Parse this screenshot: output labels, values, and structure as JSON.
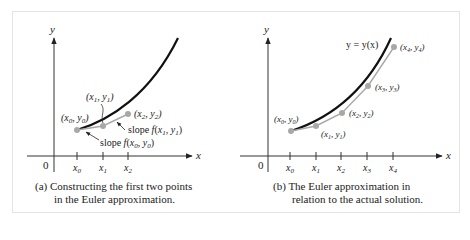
{
  "figure": {
    "panels": [
      {
        "id": "a",
        "caption_line1": "(a) Constructing the first two points",
        "caption_line2": "in the Euler approximation.",
        "y_axis_label": "y",
        "x_axis_label": "x",
        "origin_label": "0",
        "ticks": [
          "x0",
          "x1",
          "x2"
        ],
        "point_labels": [
          "(x0, y0)",
          "(x1, y1)",
          "(x2, y2)"
        ],
        "annotations": [
          "slope f(x1, y1)",
          "slope f(x0, y0)"
        ]
      },
      {
        "id": "b",
        "caption_line1": "(b) The Euler approximation in",
        "caption_line2": "relation to the actual solution.",
        "y_axis_label": "y",
        "x_axis_label": "x",
        "origin_label": "0",
        "curve_label": "y = y(x)",
        "ticks": [
          "x0",
          "x1",
          "x2",
          "x3",
          "x4"
        ],
        "point_labels": [
          "(x0, y0)",
          "(x1, y1)",
          "(x2, y2)",
          "(x3, y3)",
          "(x4, y4)"
        ]
      }
    ],
    "colors": {
      "curve": "#111111",
      "euler": "#a8a8a8",
      "axis": "#333333",
      "frame": "#e4e4e4"
    }
  }
}
